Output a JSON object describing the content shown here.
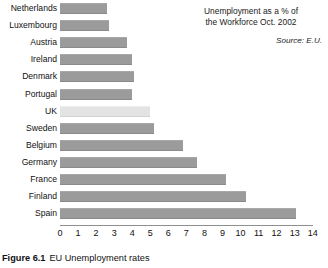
{
  "annotation": {
    "title_line1": "Unemployment as a % of",
    "title_line2": "the Workforce Oct. 2002",
    "source": "Source: E.U."
  },
  "caption": {
    "number": "Figure 6.1",
    "text": "EU Unemployment rates"
  },
  "colors": {
    "bar": "#9b9b9b",
    "bar_highlight": "#e3e3e3",
    "axis": "#8f8f8f",
    "text": "#111111",
    "background": "#ffffff"
  },
  "chart_data": {
    "type": "bar",
    "orientation": "horizontal",
    "title": "Unemployment as a % of the Workforce Oct. 2002",
    "subtitle": "Source: E.U.",
    "xlabel": "",
    "ylabel": "",
    "xlim": [
      0,
      14
    ],
    "grid": false,
    "legend": false,
    "xticks": [
      0,
      1,
      2,
      3,
      4,
      5,
      6,
      7,
      8,
      9,
      10,
      11,
      12,
      13,
      14
    ],
    "xtick_labels": [
      "0",
      "1",
      "2",
      "3",
      "4",
      "5",
      "6",
      "7",
      "8",
      "9",
      "10",
      "11",
      "12",
      "13",
      "14"
    ],
    "categories": [
      "Netherlands",
      "Luxembourg",
      "Austria",
      "Ireland",
      "Denmark",
      "Portugal",
      "UK",
      "Sweden",
      "Belgium",
      "Germany",
      "France",
      "Finland",
      "Spain"
    ],
    "values": [
      2.6,
      2.7,
      3.7,
      4.0,
      4.1,
      4.0,
      5.0,
      5.2,
      6.8,
      7.6,
      9.2,
      10.3,
      13.1
    ],
    "highlight_category": "UK"
  }
}
